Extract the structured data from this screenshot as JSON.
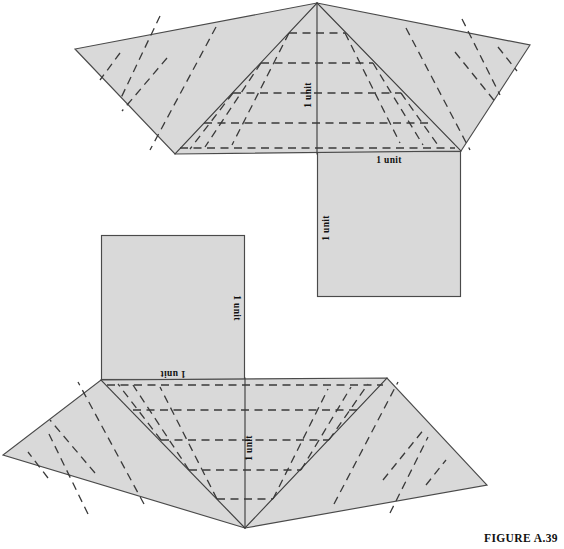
{
  "figure": {
    "caption": "FIGURE A.39",
    "style": {
      "face_fill": "#d9d9d9",
      "face_stroke": "#4a4a4a",
      "fold_stroke": "#3a3a3a",
      "background": "#ffffff"
    },
    "diagrams": [
      {
        "id": "upper-crease-pattern",
        "name": "upper-fan-net",
        "orientation": "apex-up",
        "fan": {
          "apex": [
            317,
            3
          ],
          "left_tip": [
            75,
            49
          ],
          "left_base": [
            175,
            154
          ],
          "right_base": [
            461,
            151
          ],
          "right_tip": [
            530,
            45
          ]
        },
        "square": {
          "x": 317,
          "y": 151,
          "width": 144,
          "height": 146
        },
        "labels": [
          {
            "text": "1 unit",
            "role": "fan-height",
            "x": 311,
            "y": 95,
            "rotation": -90
          },
          {
            "text": "1 unit",
            "role": "square-top",
            "x": 389,
            "y": 160,
            "rotation": 0
          },
          {
            "text": "1 unit",
            "role": "square-left",
            "x": 327,
            "y": 225,
            "rotation": -90
          }
        ],
        "fold_count_per_side": 5
      },
      {
        "id": "lower-crease-pattern",
        "name": "lower-fan-net",
        "orientation": "apex-down",
        "fan": {
          "apex": [
            245,
            528
          ],
          "left_tip": [
            3,
            455
          ],
          "left_base": [
            101,
            380
          ],
          "right_base": [
            387,
            378
          ],
          "right_tip": [
            487,
            485
          ]
        },
        "square": {
          "x": 101,
          "y": 235,
          "width": 144,
          "height": 145
        },
        "labels": [
          {
            "text": "1 unit",
            "role": "fan-height",
            "x": 252,
            "y": 448,
            "rotation": -90
          },
          {
            "text": "1 unit",
            "role": "square-bottom",
            "x": 173,
            "y": 371,
            "rotation": 180
          },
          {
            "text": "1 unit",
            "role": "square-right",
            "x": 234,
            "y": 308,
            "rotation": 90
          }
        ],
        "fold_count_per_side": 5
      }
    ]
  }
}
